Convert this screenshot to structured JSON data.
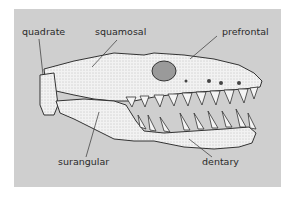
{
  "figure": {
    "background_color": "#cfcfcf",
    "labels": [
      {
        "id": "quadrate",
        "text": "quadrate"
      },
      {
        "id": "squamosal",
        "text": "squamosal"
      },
      {
        "id": "prefrontal",
        "text": "prefrontal"
      },
      {
        "id": "surangular",
        "text": "surangular"
      },
      {
        "id": "dentary",
        "text": "dentary"
      }
    ]
  }
}
